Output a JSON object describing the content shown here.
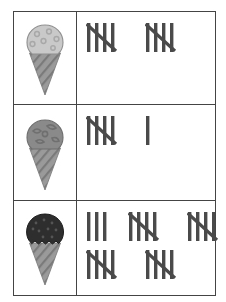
{
  "document": {
    "type": "tally-chart",
    "title": "Ice Cream Tally Chart",
    "border_color": "#444444",
    "background_color": "#ffffff",
    "tally_mark_color": "#4a4a4a",
    "rows": [
      {
        "id": "row-vanilla-sprinkles",
        "icon": {
          "name": "ice-cream-cone-vanilla-sprinkles",
          "scoop_label": "vanilla with sprinkles",
          "scoop_color": "#c9c9c9",
          "scoop_outline_color": "#8f8f8f",
          "sprinkle_color": "#a8a8a8",
          "cone_color": "#9a9a9a",
          "cone_stripe_color": "#7a7a7a",
          "sprinkle_style": "rings"
        },
        "tally": {
          "total": 10,
          "groups_of_five": 2,
          "singles": 0,
          "lines": [
            {
              "groups": [
                5,
                5
              ]
            }
          ]
        }
      },
      {
        "id": "row-mint-chip",
        "icon": {
          "name": "ice-cream-cone-medium-gray",
          "scoop_label": "medium gray swirl",
          "scoop_color": "#8a8a8a",
          "scoop_outline_color": "#6d6d6d",
          "sprinkle_color": "#6f6f6f",
          "cone_color": "#9a9a9a",
          "cone_stripe_color": "#7a7a7a",
          "sprinkle_style": "chunks"
        },
        "tally": {
          "total": 6,
          "groups_of_five": 1,
          "singles": 1,
          "lines": [
            {
              "groups": [
                5,
                1
              ]
            }
          ]
        }
      },
      {
        "id": "row-chocolate",
        "icon": {
          "name": "ice-cream-cone-chocolate",
          "scoop_label": "chocolate",
          "scoop_color": "#2e2e2e",
          "scoop_outline_color": "#1c1c1c",
          "sprinkle_color": "#555555",
          "cone_color": "#9a9a9a",
          "cone_stripe_color": "#7a7a7a",
          "sprinkle_style": "dots"
        },
        "tally": {
          "total": 23,
          "groups_of_five": 4,
          "singles": 3,
          "lines": [
            {
              "groups": [
                3,
                5,
                5
              ]
            },
            {
              "groups": [
                5,
                5
              ]
            }
          ]
        }
      }
    ]
  }
}
